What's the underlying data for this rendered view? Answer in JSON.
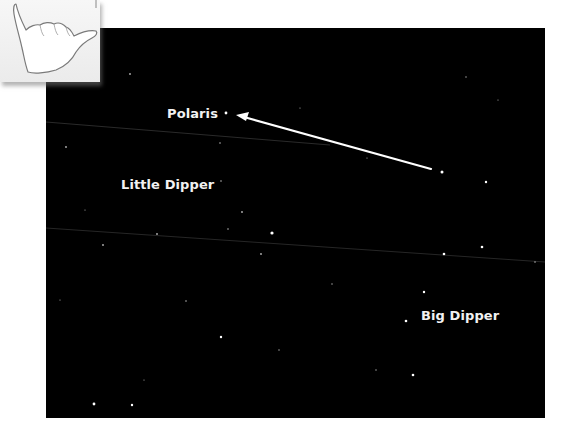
{
  "figure": {
    "labels": {
      "polaris": "Polaris",
      "little_dipper": "Little Dipper",
      "big_dipper": "Big Dipper"
    },
    "colors": {
      "sky": "#000000",
      "text": "#f2f2f2",
      "arrow": "#ffffff",
      "background": "#ffffff"
    },
    "arrow": {
      "from": [
        442,
        172
      ],
      "to": [
        226,
        113
      ],
      "description": "Pointer stars of the Big Dipper point toward Polaris"
    },
    "icon": "hang-loose-hand-icon"
  }
}
